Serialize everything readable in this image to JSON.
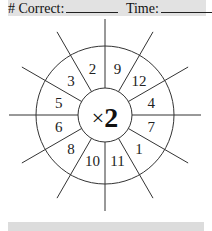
{
  "header": {
    "correct_label": "# Correct:",
    "time_label": "Time:"
  },
  "wheel": {
    "operator": "×",
    "multiplier": "2",
    "numbers": [
      "9",
      "12",
      "4",
      "7",
      "1",
      "11",
      "10",
      "8",
      "6",
      "5",
      "3",
      "2"
    ]
  }
}
